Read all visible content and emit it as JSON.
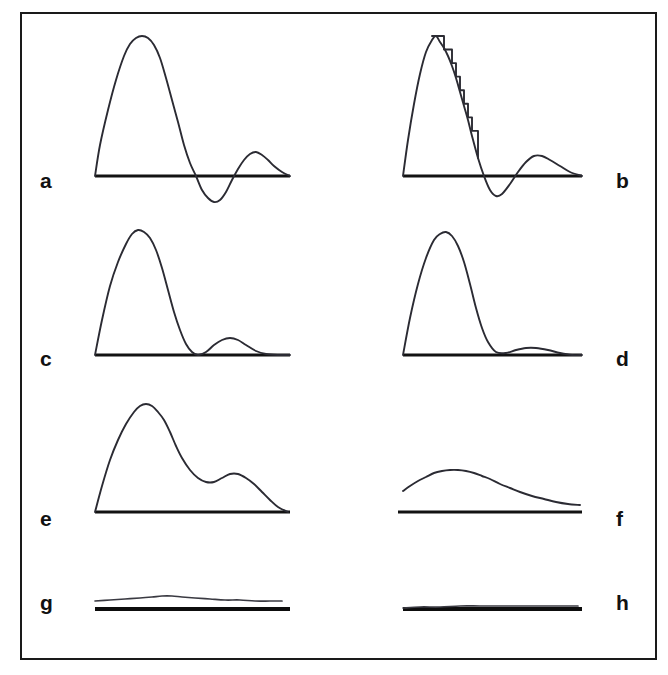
{
  "figure": {
    "background_color": "#ffffff",
    "border_color": "#1a1a1a",
    "curve_color": "#2b2b33",
    "baseline_color": "#121212",
    "panel_count": 8,
    "layout": "2 columns x 4 rows"
  },
  "labels": {
    "a": "a",
    "b": "b",
    "c": "c",
    "d": "d",
    "e": "e",
    "f": "f",
    "g": "g",
    "h": "h"
  },
  "chart_data": [
    {
      "type": "line",
      "panel": "a",
      "title": "",
      "xlabel": "",
      "ylabel": "",
      "grid": false,
      "legend": "none",
      "baseline": {
        "x0": 95,
        "x1": 290,
        "y": 176
      },
      "description": "Tall main lobe, deep negative undershoot, smaller positive rebound lobe, decaying to baseline",
      "x": [
        95,
        100,
        108,
        116,
        124,
        130,
        136,
        142,
        148,
        154,
        160,
        166,
        172,
        178,
        184,
        190,
        196,
        202,
        208,
        214,
        220,
        226,
        232,
        238,
        244,
        250,
        256,
        262,
        268,
        274,
        282,
        290
      ],
      "y": [
        176,
        145,
        110,
        80,
        56,
        44,
        38,
        36,
        38,
        45,
        58,
        78,
        100,
        122,
        145,
        163,
        176,
        190,
        198,
        202,
        200,
        192,
        180,
        169,
        160,
        154,
        152,
        155,
        160,
        166,
        172,
        176
      ]
    },
    {
      "type": "line",
      "panel": "b",
      "title": "",
      "xlabel": "",
      "ylabel": "",
      "grid": false,
      "legend": "none",
      "baseline": {
        "x0": 403,
        "x1": 582,
        "y": 176
      },
      "description": "Same shape as panel a but the falling edge of the main lobe is quantized into a visible staircase of steps",
      "staircase_steps": 9,
      "x": [
        403,
        408,
        414,
        420,
        426,
        432,
        436,
        440,
        444,
        448,
        452,
        456,
        460,
        464,
        468,
        472,
        478,
        484,
        490,
        496,
        502,
        510,
        518,
        526,
        534,
        542,
        550,
        560,
        570,
        582
      ],
      "y": [
        176,
        140,
        104,
        74,
        52,
        40,
        36,
        42,
        48,
        56,
        66,
        78,
        92,
        106,
        120,
        136,
        158,
        176,
        190,
        196,
        194,
        184,
        172,
        162,
        156,
        156,
        160,
        166,
        172,
        176
      ]
    },
    {
      "type": "line",
      "panel": "c",
      "title": "",
      "xlabel": "",
      "ylabel": "",
      "grid": false,
      "legend": "none",
      "baseline": {
        "x0": 95,
        "x1": 290,
        "y": 355
      },
      "description": "Tall main lobe with no undershoot, returning to baseline, followed by a modest secondary bump",
      "x": [
        95,
        102,
        110,
        118,
        126,
        132,
        138,
        144,
        150,
        156,
        162,
        168,
        174,
        180,
        186,
        192,
        198,
        206,
        214,
        222,
        230,
        238,
        246,
        256,
        266,
        278,
        290
      ],
      "y": [
        355,
        320,
        286,
        262,
        244,
        234,
        230,
        232,
        238,
        250,
        268,
        290,
        312,
        330,
        344,
        352,
        355,
        352,
        345,
        340,
        338,
        340,
        345,
        351,
        354,
        355,
        355
      ]
    },
    {
      "type": "line",
      "panel": "d",
      "title": "",
      "xlabel": "",
      "ylabel": "",
      "grid": false,
      "legend": "none",
      "baseline": {
        "x0": 403,
        "x1": 582,
        "y": 355
      },
      "description": "Main lobe similar to panel c but the secondary bump is nearly flattened against the baseline",
      "x": [
        403,
        410,
        418,
        426,
        434,
        440,
        446,
        452,
        458,
        464,
        470,
        476,
        482,
        488,
        496,
        506,
        516,
        526,
        536,
        548,
        560,
        572,
        582
      ],
      "y": [
        355,
        318,
        284,
        258,
        240,
        234,
        232,
        236,
        246,
        262,
        284,
        308,
        328,
        342,
        352,
        353,
        350,
        348,
        348,
        350,
        353,
        355,
        355
      ]
    },
    {
      "type": "line",
      "panel": "e",
      "title": "",
      "xlabel": "",
      "ylabel": "",
      "grid": false,
      "legend": "none",
      "baseline": {
        "x0": 95,
        "x1": 290,
        "y": 512
      },
      "description": "Broad smoothed peak with a pronounced shoulder on the falling edge, sloping down to meet the baseline at the right end",
      "x": [
        95,
        102,
        110,
        118,
        126,
        134,
        140,
        146,
        152,
        158,
        164,
        170,
        176,
        182,
        190,
        198,
        206,
        214,
        222,
        230,
        238,
        246,
        254,
        262,
        270,
        278,
        288
      ],
      "y": [
        512,
        486,
        460,
        440,
        424,
        412,
        406,
        404,
        406,
        412,
        420,
        432,
        446,
        458,
        470,
        478,
        482,
        482,
        478,
        474,
        474,
        478,
        484,
        492,
        500,
        507,
        512
      ]
    },
    {
      "type": "line",
      "panel": "f",
      "title": "",
      "xlabel": "",
      "ylabel": "",
      "grid": false,
      "legend": "none",
      "baseline": {
        "x0": 398,
        "x1": 582,
        "y": 512
      },
      "description": "Low broad single hump floating above the baseline, never touching it, with a long decaying tail",
      "x": [
        403,
        410,
        418,
        426,
        434,
        442,
        450,
        458,
        466,
        474,
        482,
        490,
        500,
        510,
        520,
        532,
        544,
        556,
        568,
        580
      ],
      "y": [
        491,
        486,
        481,
        477,
        473,
        471,
        470,
        470,
        471,
        473,
        476,
        479,
        484,
        488,
        492,
        496,
        499,
        502,
        504,
        505
      ]
    },
    {
      "type": "line",
      "panel": "g",
      "title": "",
      "xlabel": "",
      "ylabel": "",
      "grid": false,
      "legend": "none",
      "baseline": {
        "x0": 95,
        "x1": 290,
        "y": 609
      },
      "description": "Almost flat trace just above the baseline with an extremely shallow rise near the middle-left",
      "x": [
        95,
        110,
        125,
        140,
        152,
        162,
        172,
        182,
        195,
        210,
        225,
        240,
        255,
        270,
        282
      ],
      "y": [
        601,
        600,
        599,
        598,
        597,
        596,
        596,
        597,
        598,
        599,
        600,
        600,
        601,
        601,
        601
      ]
    },
    {
      "type": "line",
      "panel": "h",
      "title": "",
      "xlabel": "",
      "ylabel": "",
      "grid": false,
      "legend": "none",
      "baseline": {
        "x0": 403,
        "x1": 582,
        "y": 609
      },
      "description": "Essentially a flat line coincident with the baseline, no discernible signal",
      "x": [
        403,
        420,
        440,
        460,
        480,
        500,
        520,
        540,
        560,
        578
      ],
      "y": [
        608,
        607,
        607,
        606,
        606,
        606,
        606,
        606,
        606,
        606
      ]
    }
  ]
}
